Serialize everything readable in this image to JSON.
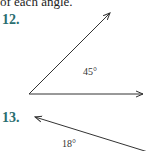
{
  "header": {
    "text": "of each angle."
  },
  "problems": [
    {
      "number": "12.",
      "angle_label": "45°"
    },
    {
      "number": "13.",
      "angle_label": "18°"
    }
  ],
  "colors": {
    "problem_number": "#2a6e70",
    "line": "#333333"
  }
}
